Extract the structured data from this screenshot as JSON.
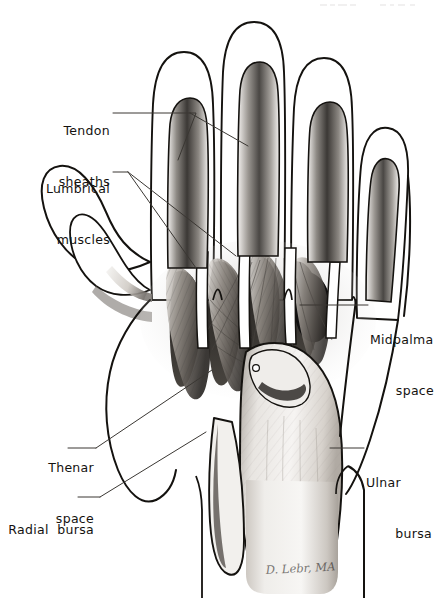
{
  "figure": {
    "medium": "pen-and-ink and pencil medical illustration",
    "background_color": "#ffffff",
    "ink_color": "#14120f",
    "width": 434,
    "height": 599
  },
  "labels": {
    "tendon_sheaths": {
      "line1": "Tendon",
      "line2": "sheaths"
    },
    "lumbrical_muscles": {
      "line1": "Lumbrical",
      "line2": "muscles"
    },
    "thenar_space": {
      "line1": "Thenar",
      "line2": "space"
    },
    "radial_bursa": {
      "line1": "Radial  bursa",
      "line2": ""
    },
    "midpalmar_space": {
      "line1": "Midpalmar",
      "line2": "space"
    },
    "ulnar_bursa": {
      "line1": "Ulnar",
      "line2": "bursa"
    }
  },
  "signature": {
    "text": "D. Lebr, MA"
  }
}
